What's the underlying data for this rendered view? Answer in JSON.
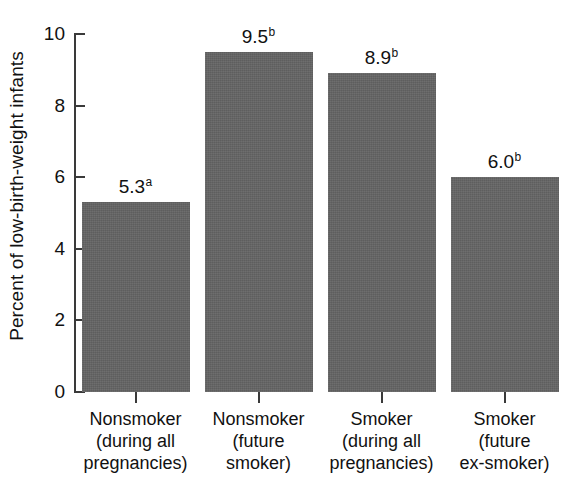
{
  "chart_data": {
    "type": "bar",
    "title": "",
    "subtitle": "",
    "xlabel": "",
    "ylabel": "Percent of low-birth-weight infants",
    "ylim": [
      0,
      10
    ],
    "yticks": [
      0,
      2,
      4,
      6,
      8,
      10
    ],
    "ytick_labels": [
      "0",
      "2",
      "4",
      "6",
      "8",
      "10"
    ],
    "grid": false,
    "legend": null,
    "bar_color": "#646464",
    "axis_color": "#3a3a3a",
    "background_color": "#ffffff",
    "categories": [
      "Nonsmoker (during all pregnancies)",
      "Nonsmoker (future smoker)",
      "Smoker (during all pregnancies)",
      "Smoker (future ex-smoker)"
    ],
    "category_label_lines": [
      [
        "Nonsmoker",
        "(during all",
        "pregnancies)"
      ],
      [
        "Nonsmoker",
        "(future",
        "smoker)"
      ],
      [
        "Smoker",
        "(during all",
        "pregnancies)"
      ],
      [
        "Smoker",
        "(future",
        "ex-smoker)"
      ]
    ],
    "values": [
      5.3,
      9.5,
      8.9,
      6.0
    ],
    "value_labels": [
      "5.3",
      "9.5",
      "8.9",
      "6.0"
    ],
    "value_label_superscripts": [
      "a",
      "b",
      "b",
      "b"
    ],
    "annotations": [
      {
        "bar": 0,
        "value_text": "5.3",
        "superscript": "a"
      },
      {
        "bar": 1,
        "value_text": "9.5",
        "superscript": "a"
      },
      {
        "bar": 2,
        "value_text": "8.9",
        "superscript": "b"
      },
      {
        "bar": 3,
        "value_text": "6.0",
        "superscript": "b"
      }
    ]
  },
  "bars": [
    {
      "value_text": "5.3",
      "superscript": "a"
    },
    {
      "value_text": "9.5",
      "superscript": "a"
    },
    {
      "value_text": "8.9",
      "superscript": "b"
    },
    {
      "value_text": "6.0",
      "superscript": "b"
    }
  ]
}
